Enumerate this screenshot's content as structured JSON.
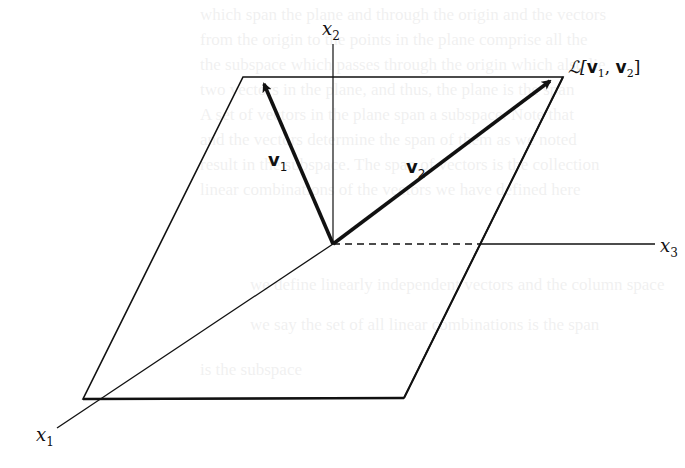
{
  "figure": {
    "type": "3D span-plane diagram",
    "background": "#ffffff",
    "line_color": "#111111",
    "axes": {
      "x1": {
        "label": "x",
        "subscript": "1"
      },
      "x2": {
        "label": "x",
        "subscript": "2"
      },
      "x3": {
        "label": "x",
        "subscript": "3"
      }
    },
    "vectors": {
      "v1": {
        "label": "v",
        "subscript": "1"
      },
      "v2": {
        "label": "v",
        "subscript": "2"
      }
    },
    "plane": {
      "label_prefix": "ℒ[",
      "label_v1": "v",
      "label_v1_sub": "1",
      "label_sep": ", ",
      "label_v2": "v",
      "label_v2_sub": "2",
      "label_suffix": "]"
    },
    "geometry": {
      "origin": [
        333,
        244
      ],
      "plane_corners": [
        [
          243,
          77
        ],
        [
          563,
          77
        ],
        [
          404,
          398
        ],
        [
          83,
          399
        ]
      ],
      "x2_axis_top": [
        333,
        44
      ],
      "x3_axis_dash_end": [
        482,
        244
      ],
      "x3_axis_end": [
        655,
        244
      ],
      "x1_axis_end": [
        57,
        428
      ],
      "v1_tip": [
        262,
        81
      ],
      "v2_tip": [
        552,
        78
      ]
    }
  }
}
